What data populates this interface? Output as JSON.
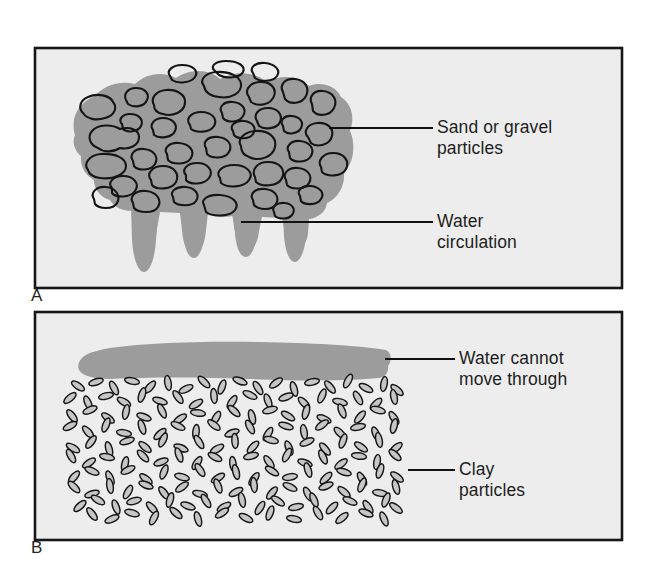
{
  "figure": {
    "background_color": "#ffffff",
    "panel_fill_color": "#ededed",
    "panel_border_color": "#171717",
    "water_color": "#9c9c9c",
    "particle_outline_color": "#1a1a1a"
  },
  "panels": [
    {
      "id": "A",
      "letter": "A",
      "description": "Sand or gravel with water circulating through large pore spaces",
      "bounds": {
        "x": 35,
        "y": 48,
        "width": 587,
        "height": 240
      },
      "callouts": [
        {
          "name": "sand-or-gravel-particles",
          "text": "Sand or gravel\nparticles",
          "leader": {
            "x1": 329,
            "y1": 128,
            "x2": 433,
            "y2": 128
          }
        },
        {
          "name": "water-circulation",
          "text": "Water\ncirculation",
          "leader": {
            "x1": 241,
            "y1": 222,
            "x2": 433,
            "y2": 222
          }
        }
      ]
    },
    {
      "id": "B",
      "letter": "B",
      "description": "Clay particles packed so tightly that water cannot move through",
      "bounds": {
        "x": 35,
        "y": 312,
        "width": 587,
        "height": 228
      },
      "callouts": [
        {
          "name": "water-cannot-move-through",
          "text": "Water cannot\nmove through",
          "leader": {
            "x1": 385,
            "y1": 359,
            "x2": 455,
            "y2": 359
          }
        },
        {
          "name": "clay-particles",
          "text": "Clay\nparticles",
          "leader": {
            "x1": 408,
            "y1": 470,
            "x2": 455,
            "y2": 470
          }
        }
      ]
    }
  ]
}
